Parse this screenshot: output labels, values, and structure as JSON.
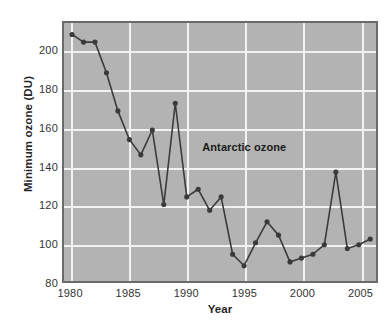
{
  "chart_data": {
    "type": "line",
    "title": "",
    "annotation": "Antarctic ozone",
    "xlabel": "Year",
    "ylabel": "Minimum ozone (DU)",
    "xlim": [
      1979.3,
      1906.5
    ],
    "x_axis_range": [
      1979.3,
      2006.5
    ],
    "ylim": [
      80,
      215
    ],
    "y_axis_range": [
      80,
      215
    ],
    "grid": true,
    "legend": "none",
    "marker": "circle",
    "line_color": "#3a3a3a",
    "marker_color": "#3a3a3a",
    "plot_background": "#b3b3b3",
    "gridline_color": "#f2f2f2",
    "frame_color": "#6b6b6b",
    "page_background": "#ffffff",
    "xticks": [
      1980,
      1985,
      1990,
      1995,
      2000,
      2005
    ],
    "xtick_labels": [
      "1980",
      "1985",
      "1990",
      "1995",
      "2000",
      "2005"
    ],
    "yticks": [
      80,
      100,
      120,
      140,
      160,
      180,
      200
    ],
    "ytick_labels": [
      "80",
      "100",
      "120",
      "140",
      "160",
      "180",
      "200"
    ],
    "x": [
      1980,
      1981,
      1982,
      1983,
      1984,
      1985,
      1986,
      1987,
      1988,
      1989,
      1990,
      1991,
      1992,
      1993,
      1994,
      1995,
      1996,
      1997,
      1998,
      1999,
      2000,
      2001,
      2002,
      2003,
      2004,
      2005,
      2006
    ],
    "values": [
      209,
      205,
      205,
      189,
      169,
      154,
      146,
      159,
      120,
      173,
      124,
      128,
      117,
      124,
      94,
      88,
      100,
      111,
      104,
      90,
      92,
      94,
      99,
      137,
      97,
      99,
      102
    ],
    "series": [
      {
        "name": "Antarctic ozone",
        "x": [
          1980,
          1981,
          1982,
          1983,
          1984,
          1985,
          1986,
          1987,
          1988,
          1989,
          1990,
          1991,
          1992,
          1993,
          1994,
          1995,
          1996,
          1997,
          1998,
          1999,
          2000,
          2001,
          2002,
          2003,
          2004,
          2005,
          2006
        ],
        "values": [
          209,
          205,
          205,
          189,
          169,
          154,
          146,
          159,
          120,
          173,
          124,
          128,
          117,
          124,
          94,
          88,
          100,
          111,
          104,
          90,
          92,
          94,
          99,
          137,
          97,
          99,
          102
        ]
      }
    ]
  },
  "artifact": {
    "mark": ""
  }
}
